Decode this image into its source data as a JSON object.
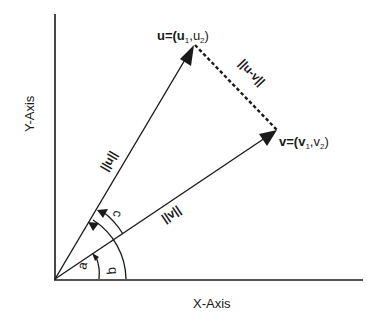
{
  "diagram": {
    "type": "vector-geometry",
    "axes": {
      "x_label": "X-Axis",
      "y_label": "Y-Axis"
    },
    "vectors": [
      {
        "id": "u",
        "name": "u",
        "label": "u=(u",
        "sub1": "1",
        "sep": ",u",
        "sub2": "2",
        "close": ")",
        "norm_label": "||u||"
      },
      {
        "id": "v",
        "name": "v",
        "label": "v=(v",
        "sub1": "1",
        "sep": ",v",
        "sub2": "2",
        "close": ")",
        "norm_label": "||v||"
      }
    ],
    "difference": {
      "label": "||u-v||",
      "style": "dashed"
    },
    "angles": [
      {
        "id": "a",
        "label": "a",
        "from": "x-axis",
        "to": "v"
      },
      {
        "id": "b",
        "label": "b",
        "from": "x-axis",
        "to": "u"
      },
      {
        "id": "c",
        "label": "c",
        "from": "v",
        "to": "u"
      }
    ],
    "colors": {
      "ink": "#1a1a1a",
      "background": "#ffffff"
    }
  }
}
